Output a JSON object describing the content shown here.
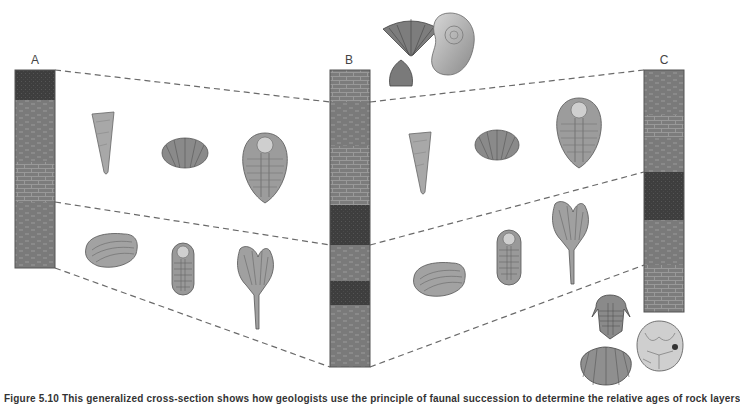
{
  "figure": {
    "caption_visible_fragment": "Figure 5.10 This generalized cross-section shows how geologists use the principle of faunal succession to determine the relative ages of rock layers",
    "columns": [
      {
        "id": "A",
        "label": "A"
      },
      {
        "id": "B",
        "label": "B"
      },
      {
        "id": "C",
        "label": "C"
      }
    ],
    "lithology_legend": {
      "sandstone": "#3e3e3e",
      "shale": "#7a7a7a",
      "limestone": "#7c7c7c",
      "outline": "#555555",
      "correlation_line": "#666666"
    },
    "column_layers": {
      "A": [
        "sandstone",
        "shale",
        "limestone",
        "shale"
      ],
      "B": [
        "limestone",
        "shale",
        "limestone",
        "sandstone",
        "shale",
        "sandstone",
        "shale"
      ],
      "C": [
        "shale",
        "limestone",
        "shale",
        "sandstone",
        "shale",
        "limestone"
      ]
    },
    "fossil_groups": {
      "top_of_B": [
        "brachiopod-spiriferid",
        "ammonoid",
        "brachiopod-small"
      ],
      "upper_zone_A_B": [
        "horn-coral",
        "brachiopod-ribbed",
        "trilobite-large"
      ],
      "lower_zone_A_B": [
        "clam-bivalve",
        "trilobite-small",
        "crinoid"
      ],
      "upper_zone_B_C": [
        "horn-coral",
        "brachiopod-ribbed",
        "trilobite-large"
      ],
      "lower_zone_B_C": [
        "clam-bivalve",
        "trilobite-small",
        "crinoid"
      ],
      "bottom_of_C": [
        "trilobite-spined",
        "brachiopod-strophomenid",
        "cystoid"
      ]
    }
  }
}
